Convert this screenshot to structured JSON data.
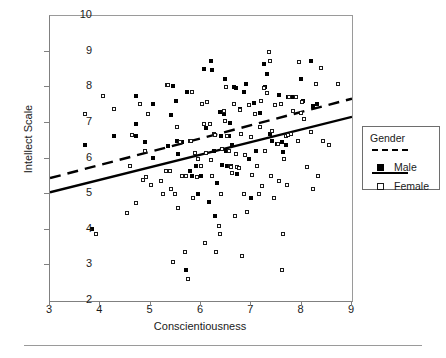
{
  "chart_data": {
    "type": "scatter",
    "title": "",
    "xlabel": "Conscientiousness",
    "ylabel": "Intellect Scale",
    "xlim": [
      3,
      9
    ],
    "ylim": [
      2,
      10
    ],
    "xticks": [
      3,
      4,
      5,
      6,
      7,
      8,
      9
    ],
    "yticks": [
      2,
      3,
      4,
      5,
      6,
      7,
      8,
      9,
      10
    ],
    "grid": false,
    "legend": {
      "position": "right",
      "title": "Gender",
      "entries": [
        {
          "label": "Male",
          "marker": "filled-square",
          "line": "dashed",
          "color": "#000000"
        },
        {
          "label": "Female",
          "marker": "open-square",
          "line": "solid",
          "color": "#000000"
        }
      ]
    },
    "series": [
      {
        "name": "Male",
        "marker": "filled-square",
        "fit_line": {
          "style": "dashed",
          "x": [
            3,
            9
          ],
          "y": [
            5.45,
            7.68
          ]
        },
        "points": [
          [
            3.7,
            6.37
          ],
          [
            3.83,
            4.01
          ],
          [
            4.28,
            6.64
          ],
          [
            4.7,
            7.75
          ],
          [
            4.7,
            6.96
          ],
          [
            4.7,
            6.64
          ],
          [
            4.88,
            6.45
          ],
          [
            5.05,
            7.52
          ],
          [
            5.05,
            6.01
          ],
          [
            5.35,
            6.35
          ],
          [
            5.4,
            7.23
          ],
          [
            5.45,
            8.03
          ],
          [
            5.5,
            7.62
          ],
          [
            5.52,
            6.48
          ],
          [
            5.55,
            6.12
          ],
          [
            5.62,
            6.46
          ],
          [
            5.68,
            3.38
          ],
          [
            5.7,
            2.88
          ],
          [
            5.72,
            7.88
          ],
          [
            5.78,
            5.64
          ],
          [
            5.8,
            6.49
          ],
          [
            5.82,
            5.51
          ],
          [
            5.9,
            5.78
          ],
          [
            5.95,
            5.0
          ],
          [
            6.0,
            5.5
          ],
          [
            6.05,
            8.5
          ],
          [
            6.1,
            6.86
          ],
          [
            6.15,
            4.78
          ],
          [
            6.2,
            8.75
          ],
          [
            6.22,
            8.49
          ],
          [
            6.25,
            6.22
          ],
          [
            6.28,
            4.39
          ],
          [
            6.32,
            5.3
          ],
          [
            6.38,
            7.3
          ],
          [
            6.4,
            6.62
          ],
          [
            6.42,
            5.82
          ],
          [
            6.45,
            7.26
          ],
          [
            6.48,
            8.24
          ],
          [
            6.5,
            6.22
          ],
          [
            6.52,
            5.8
          ],
          [
            6.55,
            6.64
          ],
          [
            6.58,
            7.0
          ],
          [
            6.6,
            5.78
          ],
          [
            6.62,
            6.38
          ],
          [
            6.65,
            8.02
          ],
          [
            6.7,
            7.98
          ],
          [
            6.72,
            5.56
          ],
          [
            6.78,
            7.4
          ],
          [
            6.85,
            7.88
          ],
          [
            6.9,
            8.1
          ],
          [
            6.95,
            6.0
          ],
          [
            7.0,
            4.89
          ],
          [
            7.05,
            7.55
          ],
          [
            7.1,
            6.2
          ],
          [
            7.18,
            7.28
          ],
          [
            7.2,
            7.62
          ],
          [
            7.25,
            8.64
          ],
          [
            7.28,
            8.02
          ],
          [
            7.32,
            8.38
          ],
          [
            7.38,
            6.7
          ],
          [
            7.42,
            6.5
          ],
          [
            7.5,
            6.4
          ],
          [
            7.55,
            7.78
          ],
          [
            7.6,
            6.45
          ],
          [
            7.62,
            6.18
          ],
          [
            7.68,
            6.38
          ],
          [
            7.72,
            7.74
          ],
          [
            7.78,
            7.74
          ],
          [
            7.85,
            7.74
          ],
          [
            7.98,
            8.22
          ],
          [
            8.02,
            7.62
          ],
          [
            8.18,
            8.75
          ],
          [
            8.22,
            7.46
          ],
          [
            8.3,
            7.52
          ]
        ]
      },
      {
        "name": "Female",
        "marker": "open-square",
        "fit_line": {
          "style": "solid",
          "x": [
            3,
            9
          ],
          "y": [
            5.05,
            7.17
          ]
        },
        "points": [
          [
            3.7,
            7.24
          ],
          [
            3.92,
            3.88
          ],
          [
            4.05,
            7.75
          ],
          [
            4.28,
            7.38
          ],
          [
            4.52,
            4.48
          ],
          [
            4.58,
            5.78
          ],
          [
            4.62,
            6.65
          ],
          [
            4.7,
            4.75
          ],
          [
            4.78,
            7.52
          ],
          [
            4.85,
            5.4
          ],
          [
            4.88,
            6.2
          ],
          [
            4.9,
            5.48
          ],
          [
            4.95,
            7.24
          ],
          [
            5.0,
            5.25
          ],
          [
            5.2,
            5.36
          ],
          [
            5.25,
            5.0
          ],
          [
            5.3,
            5.64
          ],
          [
            5.32,
            8.06
          ],
          [
            5.35,
            8.06
          ],
          [
            5.38,
            5.66
          ],
          [
            5.4,
            5.14
          ],
          [
            5.45,
            3.1
          ],
          [
            5.48,
            5.0
          ],
          [
            5.52,
            6.88
          ],
          [
            5.55,
            4.62
          ],
          [
            5.58,
            6.46
          ],
          [
            5.62,
            5.5
          ],
          [
            5.68,
            3.37
          ],
          [
            5.7,
            5.5
          ],
          [
            5.75,
            2.62
          ],
          [
            5.78,
            6.5
          ],
          [
            5.8,
            6.48
          ],
          [
            5.82,
            7.88
          ],
          [
            5.85,
            4.88
          ],
          [
            5.88,
            6.15
          ],
          [
            5.92,
            5.49
          ],
          [
            5.95,
            6.0
          ],
          [
            6.0,
            5.79
          ],
          [
            6.02,
            7.52
          ],
          [
            6.05,
            6.96
          ],
          [
            6.08,
            3.62
          ],
          [
            6.1,
            6.16
          ],
          [
            6.12,
            7.58
          ],
          [
            6.18,
            6.98
          ],
          [
            6.2,
            5.95
          ],
          [
            6.22,
            5.5
          ],
          [
            6.25,
            6.7
          ],
          [
            6.28,
            6.66
          ],
          [
            6.3,
            3.37
          ],
          [
            6.35,
            4.11
          ],
          [
            6.38,
            3.88
          ],
          [
            6.4,
            5.0
          ],
          [
            6.42,
            6.26
          ],
          [
            6.45,
            7.34
          ],
          [
            6.48,
            7.06
          ],
          [
            6.5,
            8.0
          ],
          [
            6.52,
            6.64
          ],
          [
            6.55,
            6.2
          ],
          [
            6.58,
            5.78
          ],
          [
            6.6,
            5.75
          ],
          [
            6.62,
            5.6
          ],
          [
            6.65,
            7.52
          ],
          [
            6.68,
            4.38
          ],
          [
            6.7,
            6.12
          ],
          [
            6.72,
            5.76
          ],
          [
            6.75,
            5.74
          ],
          [
            6.78,
            7.36
          ],
          [
            6.8,
            6.68
          ],
          [
            6.82,
            3.25
          ],
          [
            6.85,
            5.0
          ],
          [
            6.88,
            6.1
          ],
          [
            6.92,
            4.5
          ],
          [
            6.95,
            7.5
          ],
          [
            7.0,
            6.6
          ],
          [
            7.02,
            5.55
          ],
          [
            7.08,
            7.26
          ],
          [
            7.12,
            5.8
          ],
          [
            7.15,
            5.0
          ],
          [
            7.18,
            6.88
          ],
          [
            7.2,
            7.62
          ],
          [
            7.22,
            5.24
          ],
          [
            7.25,
            7.98
          ],
          [
            7.28,
            6.2
          ],
          [
            7.32,
            7.84
          ],
          [
            7.35,
            9.0
          ],
          [
            7.38,
            8.75
          ],
          [
            7.4,
            5.5
          ],
          [
            7.42,
            6.78
          ],
          [
            7.45,
            4.88
          ],
          [
            7.48,
            7.5
          ],
          [
            7.52,
            6.4
          ],
          [
            7.55,
            5.36
          ],
          [
            7.58,
            7.52
          ],
          [
            7.6,
            2.88
          ],
          [
            7.62,
            3.88
          ],
          [
            7.65,
            6.0
          ],
          [
            7.68,
            6.62
          ],
          [
            7.7,
            5.26
          ],
          [
            7.72,
            6.66
          ],
          [
            7.75,
            7.74
          ],
          [
            7.78,
            6.7
          ],
          [
            7.82,
            7.32
          ],
          [
            7.88,
            7.74
          ],
          [
            7.92,
            6.5
          ],
          [
            7.95,
            8.7
          ],
          [
            7.98,
            7.28
          ],
          [
            8.0,
            7.6
          ],
          [
            8.05,
            7.1
          ],
          [
            8.1,
            5.76
          ],
          [
            8.18,
            6.74
          ],
          [
            8.22,
            5.14
          ],
          [
            8.28,
            8.1
          ],
          [
            8.32,
            5.5
          ],
          [
            8.38,
            8.54
          ],
          [
            8.42,
            6.48
          ],
          [
            8.55,
            6.38
          ],
          [
            8.72,
            8.1
          ]
        ]
      }
    ]
  },
  "axes": {
    "x_title": "Conscientiousness",
    "y_title": "Intellect Scale",
    "x_tick_labels": [
      "3",
      "4",
      "5",
      "6",
      "7",
      "8",
      "9"
    ],
    "y_tick_labels": [
      "10",
      "9",
      "8",
      "7",
      "6",
      "5",
      "4",
      "3",
      "2"
    ]
  },
  "legend": {
    "title": "Gender",
    "male_label": "Male",
    "female_label": "Female"
  }
}
